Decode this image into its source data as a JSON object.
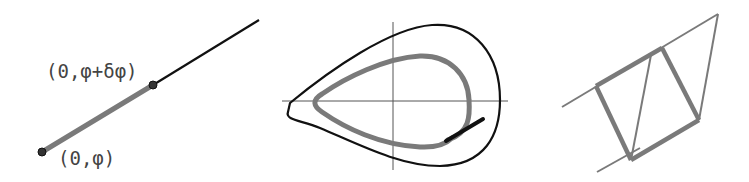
{
  "colors": {
    "black": "#111111",
    "gray": "#7a7a7a",
    "axis": "#555555",
    "label": "#444444"
  },
  "panel1": {
    "label_top": "(0,φ+δφ)",
    "label_bottom": "(0,φ)"
  },
  "panel2": {
    "description": "closed orbit with inner loop and tangent segment"
  },
  "panel3": {
    "description": "parallelogram construction between two parallel lines"
  }
}
